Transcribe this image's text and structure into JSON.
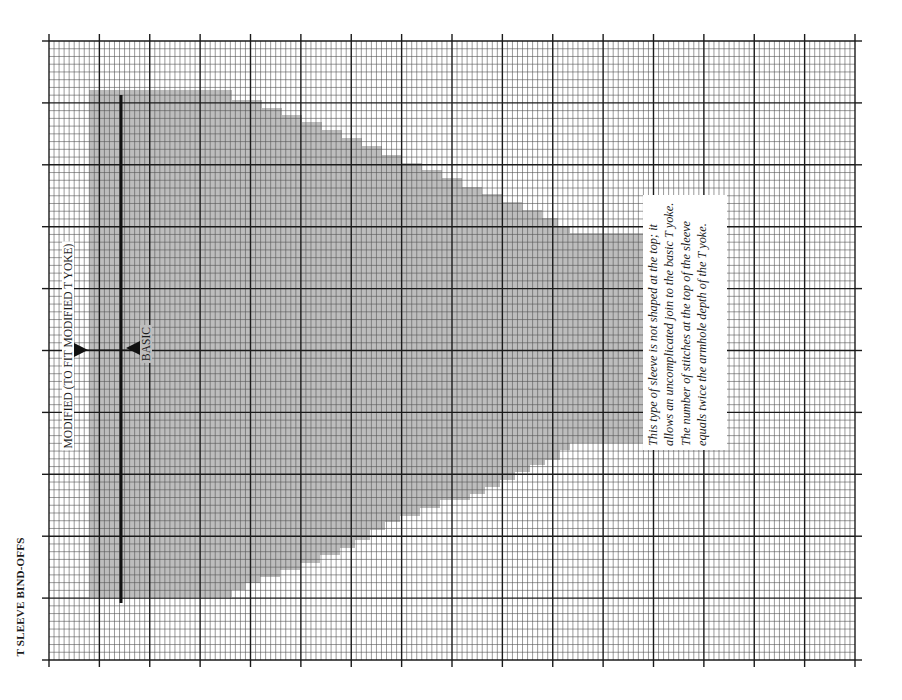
{
  "title": "T SLEEVE BIND-OFFS",
  "labels": {
    "modified": "MODIFIED (TO FIT MODIFIED T YOKE)",
    "basic": "BASIC"
  },
  "note": "This type of sleeve is not shaped at the top; it allows an uncomplicated join to the basic T yoke. The number of stitches at the top of the sleeve equals twice the armhole depth of the T yoke.",
  "colors": {
    "grid_minor": "#555555",
    "grid_major": "#1a1a1a",
    "shape_fill": "#bdbdbd",
    "marker": "#1a1a1a"
  },
  "grid": {
    "left": 49,
    "top": 41,
    "right": 855,
    "bottom": 660,
    "major_cols": 16,
    "minor_per_major_col": 10,
    "major_rows": 10,
    "minor_per_major_row": 8
  },
  "chart_data": {
    "type": "diagram",
    "title": "T SLEEVE BIND-OFFS",
    "shape_outline_px": [
      [
        89,
        90
      ],
      [
        232,
        90
      ],
      [
        232,
        100
      ],
      [
        262,
        100
      ],
      [
        262,
        108
      ],
      [
        282,
        108
      ],
      [
        282,
        115
      ],
      [
        302,
        115
      ],
      [
        302,
        122
      ],
      [
        322,
        122
      ],
      [
        322,
        130
      ],
      [
        342,
        130
      ],
      [
        342,
        138
      ],
      [
        362,
        138
      ],
      [
        362,
        146
      ],
      [
        382,
        146
      ],
      [
        382,
        155
      ],
      [
        402,
        155
      ],
      [
        402,
        163
      ],
      [
        422,
        163
      ],
      [
        422,
        170
      ],
      [
        442,
        170
      ],
      [
        442,
        178
      ],
      [
        462,
        178
      ],
      [
        462,
        187
      ],
      [
        482,
        187
      ],
      [
        482,
        194
      ],
      [
        502,
        194
      ],
      [
        502,
        202
      ],
      [
        522,
        202
      ],
      [
        522,
        210
      ],
      [
        542,
        210
      ],
      [
        542,
        218
      ],
      [
        558,
        218
      ],
      [
        558,
        226
      ],
      [
        570,
        226
      ],
      [
        570,
        233
      ],
      [
        650,
        233
      ],
      [
        650,
        443
      ],
      [
        600,
        443
      ],
      [
        570,
        443
      ],
      [
        570,
        450
      ],
      [
        560,
        450
      ],
      [
        560,
        460
      ],
      [
        545,
        460
      ],
      [
        545,
        465
      ],
      [
        530,
        465
      ],
      [
        530,
        472
      ],
      [
        515,
        472
      ],
      [
        515,
        480
      ],
      [
        500,
        480
      ],
      [
        500,
        487
      ],
      [
        485,
        487
      ],
      [
        485,
        494
      ],
      [
        470,
        494
      ],
      [
        470,
        500
      ],
      [
        440,
        500
      ],
      [
        440,
        508
      ],
      [
        420,
        508
      ],
      [
        420,
        516
      ],
      [
        400,
        516
      ],
      [
        400,
        522
      ],
      [
        385,
        522
      ],
      [
        385,
        530
      ],
      [
        370,
        530
      ],
      [
        370,
        540
      ],
      [
        355,
        540
      ],
      [
        355,
        548
      ],
      [
        340,
        548
      ],
      [
        340,
        555
      ],
      [
        320,
        555
      ],
      [
        320,
        563
      ],
      [
        300,
        563
      ],
      [
        300,
        570
      ],
      [
        280,
        570
      ],
      [
        280,
        577
      ],
      [
        260,
        577
      ],
      [
        260,
        583
      ],
      [
        245,
        583
      ],
      [
        245,
        590
      ],
      [
        232,
        590
      ],
      [
        232,
        597
      ],
      [
        89,
        597
      ]
    ],
    "bold_line": {
      "x": 121,
      "y1": 95,
      "y2": 603
    },
    "markers": [
      {
        "name": "modified",
        "x": 81,
        "y": 350,
        "direction": "down"
      },
      {
        "name": "basic",
        "x": 133,
        "y": 348,
        "direction": "up"
      }
    ]
  }
}
